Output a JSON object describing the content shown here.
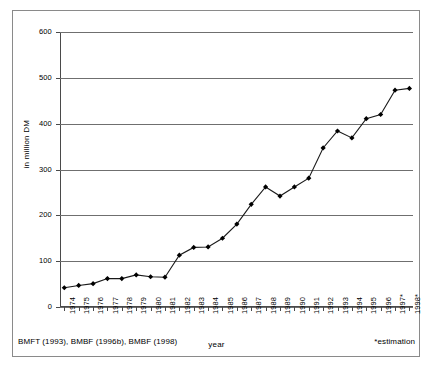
{
  "chart_data": {
    "type": "line",
    "title": "",
    "xlabel": "year",
    "ylabel": "in million DM",
    "ylim": [
      0,
      600
    ],
    "ytick_step": 100,
    "yticks": [
      0,
      100,
      200,
      300,
      400,
      500,
      600
    ],
    "grid": true,
    "legend": false,
    "marker": "diamond",
    "line_color": "#1a1a1a",
    "marker_color": "#000000",
    "grid_color": "#6f6f6f",
    "categories": [
      "1974",
      "1975",
      "1976",
      "1977",
      "1978",
      "1979",
      "1980",
      "1981",
      "1982",
      "1983",
      "1984",
      "1985",
      "1986",
      "1987",
      "1988",
      "1989",
      "1990",
      "1991",
      "1992",
      "1993",
      "1994",
      "1995",
      "1996",
      "1997*",
      "1998*"
    ],
    "values": [
      42,
      47,
      51,
      62,
      62,
      70,
      66,
      65,
      113,
      130,
      131,
      150,
      181,
      224,
      262,
      242,
      262,
      281,
      347,
      384,
      369,
      411,
      420,
      473,
      477
    ],
    "series": [
      {
        "name": "expenditure",
        "values": [
          42,
          47,
          51,
          62,
          62,
          70,
          66,
          65,
          113,
          130,
          131,
          150,
          181,
          224,
          262,
          242,
          262,
          281,
          347,
          384,
          369,
          411,
          420,
          473,
          477
        ]
      }
    ],
    "annotations": {
      "source": "BMFT (1993), BMBF (1996b), BMBF (1998)",
      "estimation": "*estimation"
    }
  }
}
